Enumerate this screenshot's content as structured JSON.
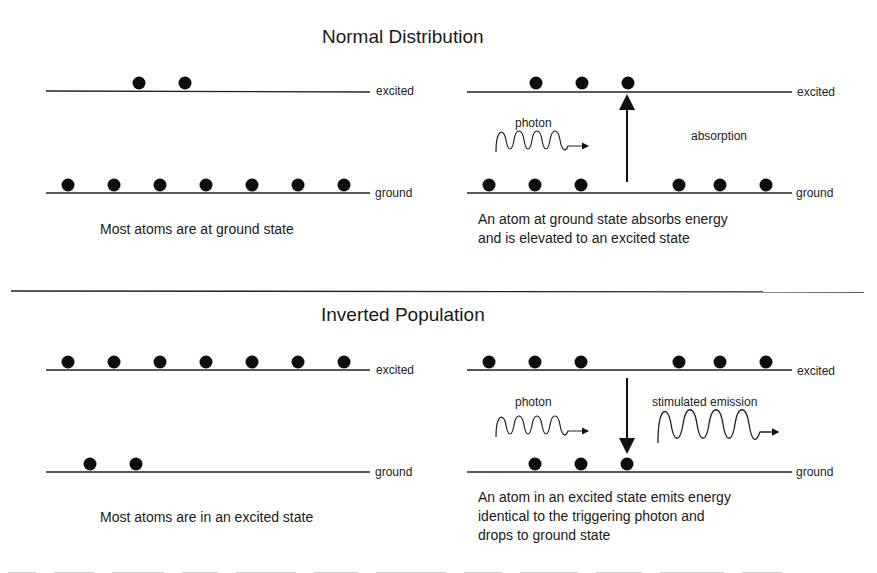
{
  "sections": {
    "normal": {
      "title": "Normal Distribution",
      "left": {
        "excited_label": "excited",
        "ground_label": "ground",
        "excited_atoms": 2,
        "ground_atoms": 7,
        "caption": "Most atoms are at ground state"
      },
      "right": {
        "excited_label": "excited",
        "ground_label": "ground",
        "excited_atoms": 3,
        "ground_atoms": 6,
        "photon_label": "photon",
        "process_label": "absorption",
        "arrow_direction": "up",
        "caption_line1": "An atom at ground state absorbs energy",
        "caption_line2": "and is elevated to an excited state"
      }
    },
    "inverted": {
      "title": "Inverted Population",
      "left": {
        "excited_label": "excited",
        "ground_label": "ground",
        "excited_atoms": 7,
        "ground_atoms": 2,
        "caption": "Most atoms are in an excited state"
      },
      "right": {
        "excited_label": "excited",
        "ground_label": "ground",
        "excited_atoms": 6,
        "ground_atoms": 3,
        "photon_label": "photon",
        "process_label": "stimulated emission",
        "arrow_direction": "down",
        "caption_line1": "An atom in an excited state emits energy",
        "caption_line2": "identical to the triggering photon and",
        "caption_line3": "drops to ground state"
      }
    }
  },
  "colors": {
    "ink": "#111111",
    "background": "#ffffff"
  }
}
